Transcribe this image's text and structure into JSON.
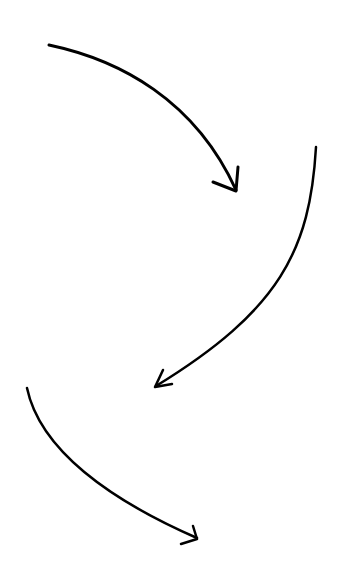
{
  "canvas": {
    "width": 343,
    "height": 576,
    "background": "#ffffff"
  },
  "style": {
    "stroke_color": "#000000"
  },
  "arrows": [
    {
      "id": "arrow-1",
      "direction": "curving down-right",
      "shaft_path": "M 49 45 C 120 60, 195 100, 236 190",
      "head_path": "M 213 182 L 236 191 L 238 167",
      "stroke_width": 3
    },
    {
      "id": "arrow-2",
      "direction": "curving down-left",
      "shaft_path": "M 316 147 C 310 250, 280 310, 156 386",
      "head_path": "M 163 370 L 155 387 L 172 384",
      "stroke_width": 2.5
    },
    {
      "id": "arrow-3",
      "direction": "curving down-right",
      "shaft_path": "M 27 388 C 40 450, 110 500, 197 538",
      "head_path": "M 193 526 L 197 539 L 181 544",
      "stroke_width": 2.5
    }
  ]
}
